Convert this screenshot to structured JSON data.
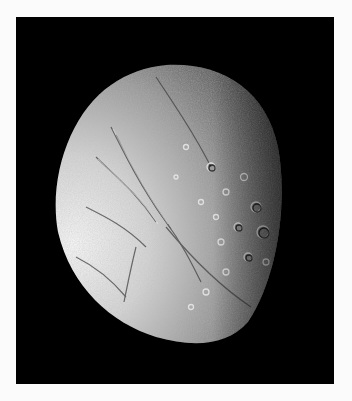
{
  "image": {
    "subject": "Grayscale photograph of an icy moon, partially illuminated, with grooved terrain on the left and heavily cratered terrain toward the terminator on the right",
    "background_color": "#000000",
    "border_color": "#fbfbfb",
    "palette": [
      "#000000",
      "#1a1a1a",
      "#5a5a5a",
      "#9a9a9a",
      "#d8d8d8",
      "#f2f2f2"
    ]
  }
}
